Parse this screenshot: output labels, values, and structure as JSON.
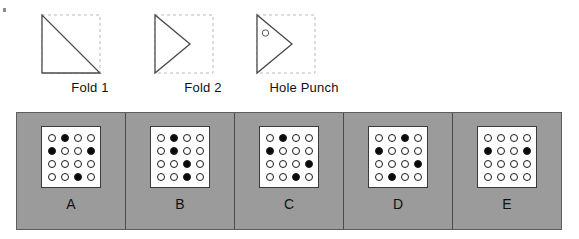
{
  "figure": {
    "type": "paper-folding-puzzle",
    "background_color": "#ffffff",
    "panel_background_color": "#9b9b9b",
    "grid_background_color": "#ffffff",
    "filled_dot_color": "#0b0b0b",
    "empty_dot_color": "#ffffff",
    "outline_color": "#1a1a1a"
  },
  "fold_sequence": {
    "steps": [
      {
        "label": "Fold 1",
        "shape": "triangle",
        "description": "right triangle, right angle at bottom-left, hypotenuse from top-left to bottom-right",
        "dashed_outline": "square",
        "hole": null
      },
      {
        "label": "Fold 2",
        "shape": "triangle",
        "description": "triangle pointing right, vertical left edge, apex at middle-right",
        "dashed_outline": "square",
        "hole": null
      },
      {
        "label": "Hole Punch",
        "shape": "triangle",
        "description": "triangle pointing right with one punched hole near upper-left",
        "dashed_outline": "square",
        "hole": {
          "count": 1,
          "position": "upper-left"
        }
      }
    ]
  },
  "answer_choices": {
    "grid_size": {
      "rows": 4,
      "cols": 4
    },
    "options": [
      {
        "label": "A",
        "grid": [
          [
            0,
            1,
            0,
            0
          ],
          [
            1,
            0,
            0,
            1
          ],
          [
            0,
            0,
            0,
            0
          ],
          [
            0,
            0,
            1,
            0
          ]
        ]
      },
      {
        "label": "B",
        "grid": [
          [
            0,
            1,
            0,
            0
          ],
          [
            0,
            1,
            0,
            0
          ],
          [
            0,
            0,
            1,
            0
          ],
          [
            0,
            0,
            1,
            0
          ]
        ]
      },
      {
        "label": "C",
        "grid": [
          [
            0,
            1,
            0,
            0
          ],
          [
            1,
            0,
            0,
            0
          ],
          [
            0,
            0,
            0,
            1
          ],
          [
            0,
            0,
            1,
            0
          ]
        ]
      },
      {
        "label": "D",
        "grid": [
          [
            0,
            0,
            1,
            0
          ],
          [
            1,
            0,
            0,
            0
          ],
          [
            0,
            0,
            0,
            1
          ],
          [
            0,
            1,
            0,
            0
          ]
        ]
      },
      {
        "label": "E",
        "grid": [
          [
            0,
            0,
            0,
            0
          ],
          [
            1,
            0,
            0,
            1
          ],
          [
            0,
            0,
            0,
            0
          ],
          [
            0,
            0,
            0,
            0
          ]
        ]
      }
    ]
  }
}
